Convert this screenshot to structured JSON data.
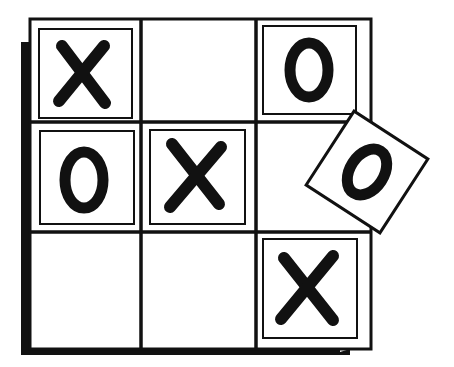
{
  "illustration": {
    "title": "Tic-tac-toe board with tiles",
    "colors": {
      "ink": "#111111",
      "paper": "#ffffff"
    },
    "grid": {
      "rows": 3,
      "cols": 3
    },
    "cells": [
      [
        "X",
        "",
        "O"
      ],
      [
        "O",
        "X",
        ""
      ],
      [
        "",
        "",
        "X"
      ]
    ],
    "tilted_tile": {
      "mark": "O",
      "near_cell": "row 2, col 3",
      "rotation_deg": 33
    }
  }
}
